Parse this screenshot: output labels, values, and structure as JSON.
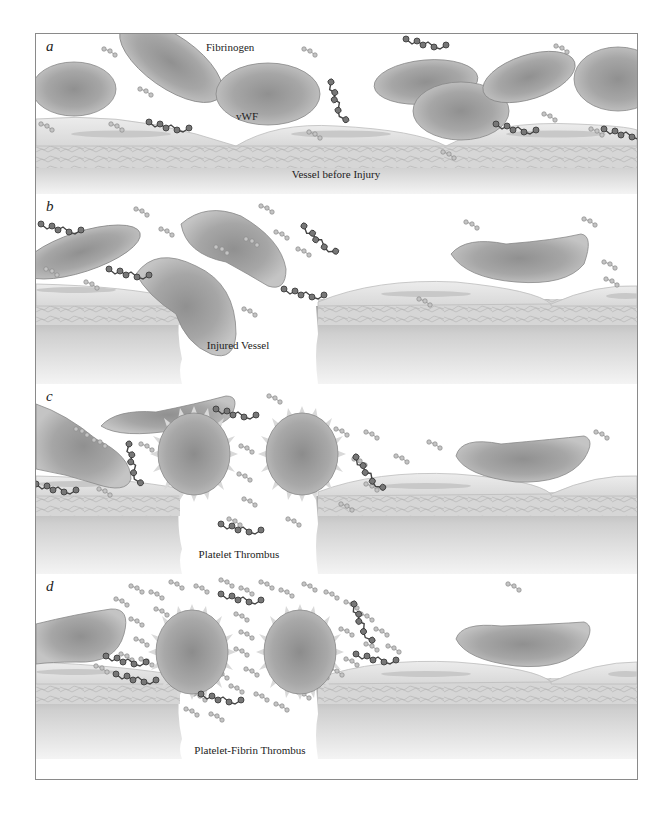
{
  "figure": {
    "panels": [
      {
        "letter": "a",
        "caption": "Vessel before Injury",
        "callouts": {
          "fibrinogen": "Fibrinogen",
          "vwf": "vWF"
        }
      },
      {
        "letter": "b",
        "caption": "Injured Vessel"
      },
      {
        "letter": "c",
        "caption": "Platelet Thrombus"
      },
      {
        "letter": "d",
        "caption": "Platelet-Fibrin Thrombus"
      }
    ]
  },
  "colors": {
    "cell_fill": "#a9a9a9",
    "cell_dark": "#8a8a8a",
    "endothelium": "#e4e4e4",
    "vessel_wall": "#cfcfcf",
    "fibrinogen": "#b5b5b5",
    "vwf": "#555555"
  }
}
